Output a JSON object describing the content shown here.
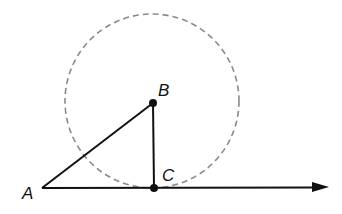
{
  "diagram": {
    "type": "geometry",
    "points": {
      "A": {
        "label": "A",
        "x": 42,
        "y": 188
      },
      "B": {
        "label": "B",
        "x": 153,
        "y": 103
      },
      "C": {
        "label": "C",
        "x": 154,
        "y": 188
      }
    },
    "circle": {
      "center": "B",
      "cx": 152,
      "cy": 101,
      "r": 87,
      "style": "dashed",
      "color": "#8a8a8a"
    },
    "segments": [
      {
        "from": "A",
        "to": "B"
      },
      {
        "from": "B",
        "to": "C"
      }
    ],
    "ray": {
      "from": "A",
      "through": "C",
      "end_x": 328,
      "end_y": 187
    },
    "colors": {
      "line": "#111111",
      "circle": "#8a8a8a",
      "background": "#ffffff"
    }
  }
}
